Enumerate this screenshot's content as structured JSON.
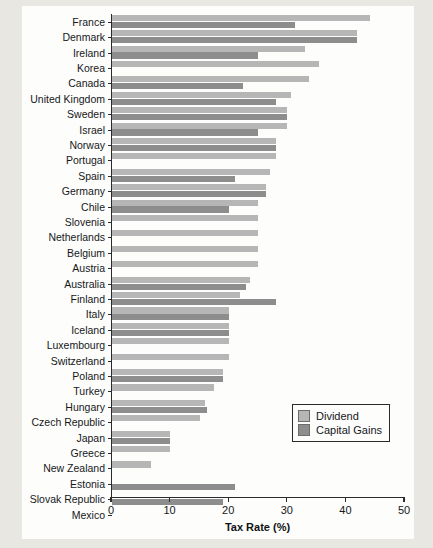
{
  "chart_data": {
    "type": "bar",
    "orientation": "horizontal",
    "title": "",
    "xlabel": "Tax Rate (%)",
    "ylabel": "",
    "xlim": [
      0,
      50
    ],
    "xticks": [
      0,
      10,
      20,
      30,
      40,
      50
    ],
    "grid": false,
    "legend_position": "center-right",
    "colors": {
      "dividend": "#b6b6b6",
      "capital_gains": "#8d8d8d",
      "axis": "#2b2b2b",
      "background": "#fdfdfc",
      "page": "#e9e7e2"
    },
    "categories": [
      "France",
      "Denmark",
      "Ireland",
      "Korea",
      "Canada",
      "United Kingdom",
      "Sweden",
      "Israel",
      "Norway",
      "Portugal",
      "Spain",
      "Germany",
      "Chile",
      "Slovenia",
      "Netherlands",
      "Belgium",
      "Austria",
      "Australia",
      "Finland",
      "Italy",
      "Iceland",
      "Luxembourg",
      "Switzerland",
      "Poland",
      "Turkey",
      "Hungary",
      "Czech Republic",
      "Japan",
      "Greece",
      "New Zealand",
      "Estonia",
      "Slovak Republic",
      "Mexico"
    ],
    "series": [
      {
        "name": "Dividend",
        "color": "#b6b6b6",
        "values": [
          44.2,
          42.0,
          33.0,
          35.4,
          33.8,
          30.6,
          30.0,
          30.0,
          28.0,
          28.0,
          27.0,
          26.4,
          25.0,
          25.0,
          25.0,
          25.0,
          25.0,
          23.6,
          22.0,
          20.0,
          20.0,
          20.0,
          20.0,
          19.0,
          17.5,
          16.0,
          15.0,
          10.0,
          10.0,
          6.7,
          0,
          0,
          0
        ]
      },
      {
        "name": "Capital Gains",
        "color": "#8d8d8d",
        "values": [
          31.4,
          42.0,
          25.0,
          0,
          22.5,
          28.0,
          30.0,
          25.0,
          28.0,
          0,
          21.0,
          26.4,
          20.0,
          0,
          0,
          0,
          0,
          23.0,
          28.0,
          20.0,
          20.0,
          0,
          0,
          19.0,
          0,
          16.2,
          0,
          10.0,
          0,
          0,
          21.0,
          19.0,
          0
        ]
      }
    ]
  },
  "legend": {
    "items": [
      {
        "label": "Dividend",
        "color": "#b6b6b6"
      },
      {
        "label": "Capital Gains",
        "color": "#8d8d8d"
      }
    ]
  },
  "axis": {
    "x_title": "Tax Rate (%)",
    "x_tick_labels": [
      "0",
      "10",
      "20",
      "30",
      "40",
      "50"
    ]
  }
}
